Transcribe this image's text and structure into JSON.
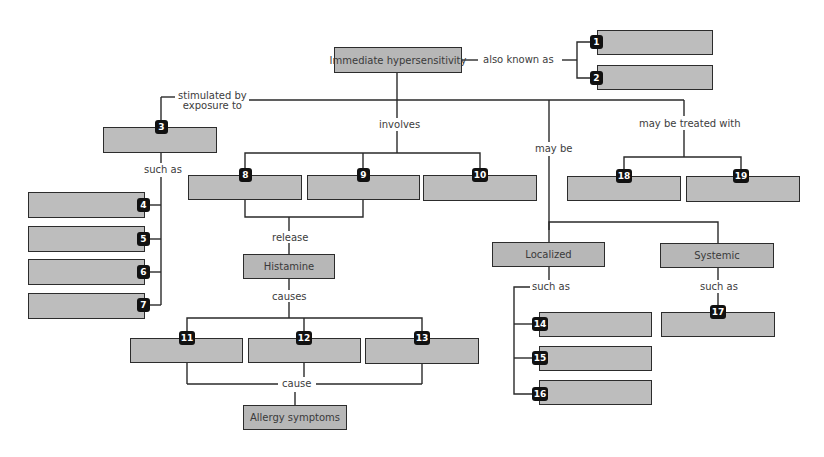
{
  "diagram": {
    "type": "concept-map",
    "colors": {
      "box_fill": "#b9b9b9",
      "box_border": "#2c2c2c",
      "badge_fill": "#111111",
      "badge_text": "#ffffff",
      "line": "#2a2a2a",
      "label_text": "#3c3c3c"
    },
    "nodes": {
      "root": "Immediate hypersensitivity",
      "histamine": "Histamine",
      "allergy_symptoms": "Allergy symptoms",
      "localized": "Localized",
      "systemic": "Systemic"
    },
    "blanks": {
      "b1": "1",
      "b2": "2",
      "b3": "3",
      "b4": "4",
      "b5": "5",
      "b6": "6",
      "b7": "7",
      "b8": "8",
      "b9": "9",
      "b10": "10",
      "b11": "11",
      "b12": "12",
      "b13": "13",
      "b14": "14",
      "b15": "15",
      "b16": "16",
      "b17": "17",
      "b18": "18",
      "b19": "19"
    },
    "links": {
      "also_known_as": "also known as",
      "stimulated_by_line1": "stimulated by",
      "stimulated_by_line2": "exposure to",
      "involves": "involves",
      "may_be": "may be",
      "may_be_treated_with": "may be treated with",
      "such_as_allergens": "such as",
      "release": "release",
      "causes": "causes",
      "cause": "cause",
      "such_as_localized": "such as",
      "such_as_systemic": "such as"
    }
  }
}
